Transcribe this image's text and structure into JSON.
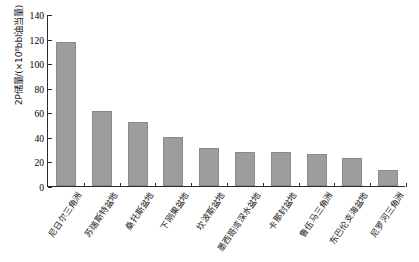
{
  "chart_data": {
    "type": "bar",
    "title": "",
    "subtitle": "",
    "xlabel": "",
    "ylabel": "2P储量/(×10⁸bbl油当量)",
    "ylim": [
      0,
      140
    ],
    "ytick_values": [
      0,
      20,
      40,
      60,
      80,
      100,
      120,
      140
    ],
    "ytick_labels": [
      "0",
      "20",
      "40",
      "60",
      "80",
      "100",
      "120",
      "140"
    ],
    "grid": false,
    "legend": null,
    "bar_color": "#9d9d9d",
    "categories": [
      "尼日尔三角洲",
      "苏瑞斯特盆地",
      "桑托斯盆地",
      "下刚果盆地",
      "坎波斯盆地",
      "墨西哥湾深水盆地",
      "卡那封盆地",
      "鲁伍马三角洲",
      "东巴伦支海盆地",
      "尼罗河三角洲"
    ],
    "values": [
      117,
      61,
      52,
      40,
      31,
      28,
      28,
      26,
      23,
      13
    ]
  }
}
